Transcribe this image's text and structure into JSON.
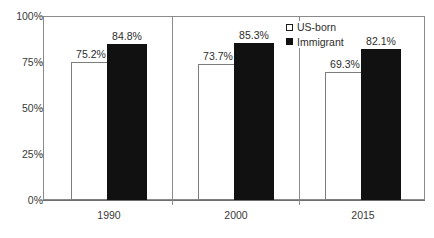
{
  "chart_data": {
    "type": "bar",
    "title": "",
    "subtitle": "",
    "xlabel": "",
    "ylabel": "",
    "categories": [
      "1990",
      "2000",
      "2015"
    ],
    "series": [
      {
        "name": "US-born",
        "values": [
          75.2,
          73.7,
          69.3
        ],
        "labels": [
          "75.2%",
          "73.7%",
          "69.3%"
        ],
        "color": "#ffffff",
        "border_color": "#7d7d7d"
      },
      {
        "name": "Immigrant",
        "values": [
          84.8,
          85.3,
          82.1
        ],
        "labels": [
          "84.8%",
          "85.3%",
          "82.1%"
        ],
        "color": "#111111",
        "border_color": "#111111"
      }
    ],
    "ylim": [
      0,
      100
    ],
    "yticks": [
      0,
      25,
      50,
      75,
      100
    ],
    "ytick_labels": [
      "0%",
      "25%",
      "50%",
      "75%",
      "100%"
    ],
    "grid": false,
    "legend_position": "top-right",
    "value_labels_shown": true
  },
  "legend": {
    "items": [
      {
        "label": "US-born",
        "marker": "hollow-square-icon"
      },
      {
        "label": "Immigrant",
        "marker": "filled-square-icon"
      }
    ]
  },
  "axes": {
    "y_tick_labels": [
      "100%",
      "75%",
      "50%",
      "25%",
      "0%"
    ],
    "x_tick_labels": [
      "1990",
      "2000",
      "2015"
    ]
  }
}
